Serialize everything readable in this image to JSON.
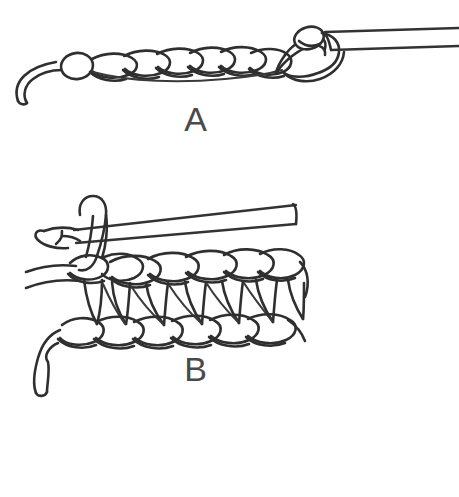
{
  "illustration": {
    "title": "Crochet stitch instructional diagram",
    "background_color": "#ffffff",
    "ink_color": "#2f2f2f",
    "style": "black and white hand-drawn line art",
    "width": 459,
    "height": 497
  },
  "figures": [
    {
      "id": "figure-a",
      "label": "A",
      "label_x": 196,
      "label_y": 131,
      "subject": "foundation chain with crochet hook",
      "description": "A horizontal row of crochet chain stitches with a yarn tail curling down at the left end and a crochet hook entering from the right holding the working loop.",
      "chain_stitch_count": 8,
      "has_hook": true,
      "hook_direction": "right",
      "yarn_tail_side": "left"
    },
    {
      "id": "figure-b",
      "label": "B",
      "label_x": 196,
      "label_y": 381,
      "subject": "row of double crochet stitches with crochet hook",
      "description": "A completed row of double crochet stitches worked into a foundation chain, with a turning chain and the crochet hook held at the top left, and a yarn tail hanging at the lower left.",
      "post_stitch_count": 6,
      "top_chain_row": true,
      "bottom_chain_row": true,
      "has_hook": true,
      "hook_direction": "right",
      "yarn_tail_side": "left"
    }
  ],
  "footer": {
    "cut_off_caption": "",
    "note": "faint cut-off tops of letters at the bottom edge"
  }
}
